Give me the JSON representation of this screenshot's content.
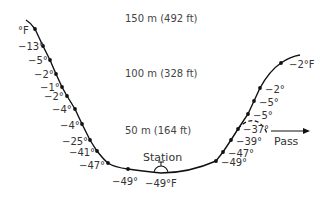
{
  "altitude_labels": [
    {
      "text": "150 m (492 ft)",
      "x": 125,
      "y": 13
    },
    {
      "text": "100 m (328 ft)",
      "x": 125,
      "y": 68
    },
    {
      "text": "50 m (164 ft)",
      "x": 125,
      "y": 125
    }
  ],
  "left_slope": {
    "unit_label": "°F",
    "points": [
      {
        "label": "°F",
        "dot": [
          35,
          29
        ],
        "lx": 18,
        "ly": 25
      },
      {
        "label": "−13°",
        "dot": [
          43,
          46
        ],
        "lx": 18,
        "ly": 41
      },
      {
        "label": "−5°",
        "dot": [
          50,
          60
        ],
        "lx": 28,
        "ly": 55
      },
      {
        "label": "−2°",
        "dot": [
          56,
          74
        ],
        "lx": 34,
        "ly": 69
      },
      {
        "label": "−1°",
        "dot": [
          62,
          87
        ],
        "lx": 40,
        "ly": 82
      },
      {
        "label": "−2°",
        "dot": [
          67,
          96
        ],
        "lx": 44,
        "ly": 91
      },
      {
        "label": "−4°",
        "dot": [
          75,
          109
        ],
        "lx": 52,
        "ly": 104
      },
      {
        "label": "−4°",
        "dot": [
          82,
          124
        ],
        "lx": 60,
        "ly": 120
      },
      {
        "label": "−25°",
        "dot": [
          90,
          140
        ],
        "lx": 62,
        "ly": 136
      },
      {
        "label": "−41°",
        "dot": [
          97,
          151
        ],
        "lx": 69,
        "ly": 147
      },
      {
        "label": "−47°",
        "dot": [
          108,
          163
        ],
        "lx": 79,
        "ly": 160
      }
    ]
  },
  "valley": {
    "points": [
      {
        "label": "−49°",
        "dot": [
          128,
          169
        ],
        "lx": 112,
        "ly": 176
      }
    ],
    "station": {
      "label": "Station",
      "temp": "−49°F",
      "x": 161,
      "y": 172
    }
  },
  "right_slope": {
    "points": [
      {
        "label": "−49°",
        "dot": [
          216,
          161
        ],
        "lx": 221,
        "ly": 157
      },
      {
        "label": "−47°",
        "dot": [
          223,
          152
        ],
        "lx": 228,
        "ly": 148
      },
      {
        "label": "−39°",
        "dot": [
          231,
          140
        ],
        "lx": 236,
        "ly": 136
      },
      {
        "label": "−37°",
        "dot": [
          238,
          129
        ],
        "lx": 243,
        "ly": 124
      },
      {
        "label": "−5°",
        "dot": [
          248,
          114
        ],
        "lx": 253,
        "ly": 110
      },
      {
        "label": "−5°",
        "dot": [
          254,
          101
        ],
        "lx": 259,
        "ly": 97
      },
      {
        "label": "−2°",
        "dot": [
          260,
          88
        ],
        "lx": 265,
        "ly": 84
      },
      {
        "label": "−2°F",
        "dot": [
          281,
          63
        ],
        "lx": 289,
        "ly": 59
      }
    ]
  },
  "pass": {
    "label": "Pass",
    "x": 274,
    "y": 134
  }
}
